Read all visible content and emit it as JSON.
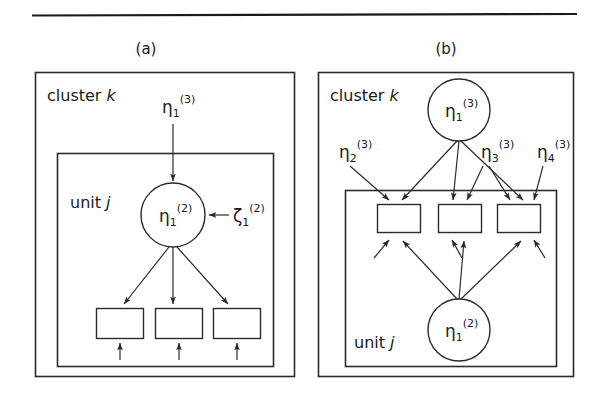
{
  "figure": {
    "has_top_rule": true,
    "background": "#ffffff",
    "ink_color": "#2b2b2b",
    "panels": [
      {
        "id": "a",
        "label": "(a)",
        "outer_frame_label": "cluster",
        "outer_frame_label_italic": "k",
        "inner_frame_label": "unit",
        "inner_frame_label_italic": "j",
        "nodes": {
          "latent_top": {
            "name": "eta",
            "sub": "1",
            "sup": "(3)",
            "shape": "free-label"
          },
          "latent_circle": {
            "name": "η",
            "sub": "1",
            "sup": "(2)",
            "shape": "circle"
          },
          "disturbance": {
            "name": "ζ",
            "sub": "1",
            "sup": "(2)",
            "shape": "free-label"
          }
        },
        "indicator_count": 3,
        "residual_arrow_count": 3
      },
      {
        "id": "b",
        "label": "(b)",
        "outer_frame_label": "cluster",
        "outer_frame_label_italic": "k",
        "inner_frame_label": "unit",
        "inner_frame_label_italic": "j",
        "nodes": {
          "cluster_circle": {
            "name": "η",
            "sub": "1",
            "sup": "(3)",
            "shape": "circle"
          },
          "eta2": {
            "name": "η",
            "sub": "2",
            "sup": "(3)",
            "shape": "free-label"
          },
          "eta3": {
            "name": "η",
            "sub": "3",
            "sup": "(3)",
            "shape": "free-label"
          },
          "eta4": {
            "name": "η",
            "sub": "4",
            "sup": "(3)",
            "shape": "free-label"
          },
          "unit_circle": {
            "name": "η",
            "sub": "1",
            "sup": "(2)",
            "shape": "circle"
          }
        },
        "indicator_count": 3,
        "residual_arrow_count": 3
      }
    ],
    "glyphs": {
      "eta": "η",
      "zeta": "ζ"
    }
  }
}
